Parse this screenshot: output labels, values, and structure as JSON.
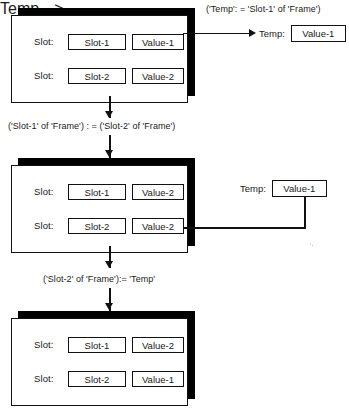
{
  "diagram": {
    "row_label": "Slot:",
    "temp_label": "Temp:",
    "captions": {
      "step1": "('Temp': = 'Slot-1' of 'Frame')",
      "step2": "('Slot-1' of 'Frame') : = ('Slot-2' of 'Frame')",
      "step3": "('Slot-2' of 'Frame'):= 'Temp'"
    },
    "stages": [
      {
        "id": "stage-initial",
        "rows": [
          {
            "slot_label": "Slot:",
            "name": "Slot-1",
            "value": "Value-1"
          },
          {
            "slot_label": "Slot:",
            "name": "Slot-2",
            "value": "Value-2"
          }
        ],
        "temp": {
          "label": "Temp:",
          "value": "Value-1"
        }
      },
      {
        "id": "stage-after-copy",
        "rows": [
          {
            "slot_label": "Slot:",
            "name": "Slot-1",
            "value": "Value-2"
          },
          {
            "slot_label": "Slot:",
            "name": "Slot-2",
            "value": "Value-2"
          }
        ],
        "temp": {
          "label": "Temp:",
          "value": "Value-1"
        }
      },
      {
        "id": "stage-final",
        "rows": [
          {
            "slot_label": "Slot:",
            "name": "Slot-1",
            "value": "Value-2"
          },
          {
            "slot_label": "Slot:",
            "name": "Slot-2",
            "value": "Value-1"
          }
        ]
      }
    ],
    "colors": {
      "ink": "#111111",
      "shadow": "#000000",
      "paper": "#ffffff"
    }
  }
}
